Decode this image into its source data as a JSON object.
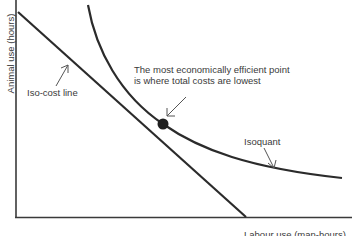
{
  "diagram": {
    "axes": {
      "y_label": "Animal use (hours)",
      "x_label": "Labour use (man-hours)"
    },
    "labels": {
      "iso_cost": "Iso-cost line",
      "isoquant": "Isoquant",
      "callout_line1": "The  most economically efficient point",
      "callout_line2": "is where  total costs are lowest"
    },
    "colors": {
      "line": "#2b2b2b",
      "text": "#3a3a3a",
      "background": "#ffffff"
    },
    "elements": [
      {
        "type": "line",
        "name": "iso-cost line",
        "from": [
          18,
          12
        ],
        "to": [
          246,
          217
        ]
      },
      {
        "type": "curve",
        "name": "isoquant",
        "through": [
          [
            88,
            5
          ],
          [
            163,
            124
          ],
          [
            342,
            178
          ]
        ]
      },
      {
        "type": "point",
        "name": "efficient point",
        "at": [
          163,
          124
        ]
      }
    ]
  }
}
